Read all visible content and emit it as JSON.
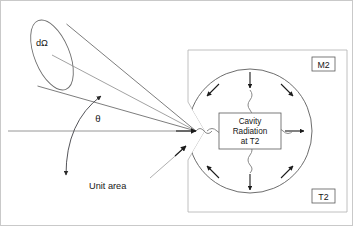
{
  "figure": {
    "type": "physics-diagram",
    "background_color": "#ffffff",
    "frame_color": "#c9c9c9"
  },
  "labels": {
    "solid_angle": "dΩ",
    "angle": "θ",
    "unit_area": "Unit area",
    "cavity_line1": "Cavity",
    "cavity_line2": "Radiation",
    "cavity_line3": "at T2",
    "material": "M2",
    "temperature": "T2"
  },
  "colors": {
    "line": "#6e6e6e",
    "arrow": "#1b1b1b",
    "hatch": "#b4b4b4",
    "text": "#161616",
    "cavity_stroke": "#5c5c5c"
  },
  "geometry": {
    "cone_apex": "196,131",
    "cone_base_center": "52,55",
    "cavity_center": "250,131",
    "cavity_radius": "62",
    "block_rect": "188,50,159,162"
  }
}
